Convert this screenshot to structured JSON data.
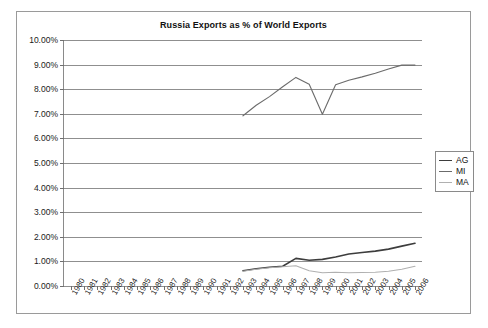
{
  "chart_data": {
    "type": "line",
    "title": "Russia Exports as % of World Exports",
    "xlabel": "",
    "ylabel": "",
    "grid": true,
    "legend_position": "right",
    "ylim": [
      0,
      10
    ],
    "ytick_labels": [
      "0.00%",
      "1.00%",
      "2.00%",
      "3.00%",
      "4.00%",
      "5.00%",
      "6.00%",
      "7.00%",
      "8.00%",
      "9.00%",
      "10.00%"
    ],
    "ytick_values": [
      0,
      1,
      2,
      3,
      4,
      5,
      6,
      7,
      8,
      9,
      10
    ],
    "categories": [
      "1980",
      "1981",
      "1982",
      "1983",
      "1984",
      "1985",
      "1986",
      "1987",
      "1988",
      "1989",
      "1990",
      "1991",
      "1992",
      "1993",
      "1994",
      "1995",
      "1996",
      "1997",
      "1998",
      "1999",
      "2000",
      "2001",
      "2002",
      "2003",
      "2004",
      "2005",
      "2006"
    ],
    "series": [
      {
        "name": "AG",
        "color": "#3d3d3d",
        "width": 1.6,
        "values": [
          null,
          null,
          null,
          null,
          null,
          null,
          null,
          null,
          null,
          null,
          null,
          null,
          null,
          0.62,
          0.7,
          0.76,
          0.8,
          1.12,
          1.05,
          1.08,
          1.18,
          1.3,
          1.36,
          1.42,
          1.5,
          1.62,
          1.74
        ]
      },
      {
        "name": "MI",
        "color": "#6b6b6b",
        "width": 1.1,
        "values": [
          null,
          null,
          null,
          null,
          null,
          null,
          null,
          null,
          null,
          null,
          null,
          null,
          null,
          6.92,
          7.35,
          7.7,
          8.1,
          8.48,
          8.2,
          6.98,
          8.18,
          8.36,
          8.5,
          8.65,
          8.82,
          8.98,
          8.98
        ]
      },
      {
        "name": "MA",
        "color": "#b0b0b0",
        "width": 1.1,
        "values": [
          null,
          null,
          null,
          null,
          null,
          null,
          null,
          null,
          null,
          null,
          null,
          null,
          null,
          0.6,
          0.68,
          0.74,
          0.78,
          0.82,
          0.62,
          0.54,
          0.56,
          0.54,
          0.55,
          0.56,
          0.6,
          0.68,
          0.8
        ]
      }
    ]
  },
  "legend": {
    "items": [
      {
        "label": "AG",
        "color": "#3d3d3d"
      },
      {
        "label": "MI",
        "color": "#6b6b6b"
      },
      {
        "label": "MA",
        "color": "#b0b0b0"
      }
    ]
  }
}
